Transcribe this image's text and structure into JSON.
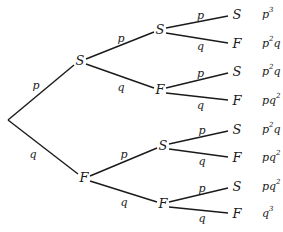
{
  "diagram": {
    "type": "probability-tree",
    "root": {
      "x": 8,
      "y": 120
    },
    "level1": [
      {
        "label": "S",
        "x": 80,
        "y": 61,
        "edge_label": "p",
        "edge_label_pos": [
          36,
          86
        ]
      },
      {
        "label": "F",
        "x": 84,
        "y": 178,
        "edge_label": "q",
        "edge_label_pos": [
          33,
          155
        ]
      }
    ],
    "level2": [
      {
        "label": "S",
        "parent": 0,
        "x": 160,
        "y": 30,
        "edge_label": "p",
        "edge_label_pos": [
          121,
          39
        ]
      },
      {
        "label": "F",
        "parent": 0,
        "x": 160,
        "y": 90,
        "edge_label": "q",
        "edge_label_pos": [
          121,
          88
        ]
      },
      {
        "label": "S",
        "parent": 1,
        "x": 163,
        "y": 146,
        "edge_label": "p",
        "edge_label_pos": [
          124,
          155
        ]
      },
      {
        "label": "F",
        "parent": 1,
        "x": 163,
        "y": 204,
        "edge_label": "q",
        "edge_label_pos": [
          124,
          203
        ]
      }
    ],
    "leaves": [
      {
        "label": "S",
        "parent": 0,
        "y": 15,
        "edge_label": "p",
        "prob_base": "p",
        "prob_sup": "3",
        "prob_tail": ""
      },
      {
        "label": "F",
        "parent": 0,
        "y": 44,
        "edge_label": "q",
        "prob_base": "p",
        "prob_sup": "2",
        "prob_tail": "q"
      },
      {
        "label": "S",
        "parent": 1,
        "y": 72,
        "edge_label": "p",
        "prob_base": "p",
        "prob_sup": "2",
        "prob_tail": "q"
      },
      {
        "label": "F",
        "parent": 1,
        "y": 101,
        "edge_label": "q",
        "prob_base": "pq",
        "prob_sup": "2",
        "prob_tail": ""
      },
      {
        "label": "S",
        "parent": 2,
        "y": 130,
        "edge_label": "p",
        "prob_base": "p",
        "prob_sup": "2",
        "prob_tail": "q"
      },
      {
        "label": "F",
        "parent": 2,
        "y": 158,
        "edge_label": "q",
        "prob_base": "pq",
        "prob_sup": "2",
        "prob_tail": ""
      },
      {
        "label": "S",
        "parent": 3,
        "y": 187,
        "edge_label": "p",
        "prob_base": "pq",
        "prob_sup": "2",
        "prob_tail": ""
      },
      {
        "label": "F",
        "parent": 3,
        "y": 214,
        "edge_label": "q",
        "prob_base": "q",
        "prob_sup": "3",
        "prob_tail": ""
      }
    ],
    "leaf_x": 237,
    "prob_x": 262,
    "colors": {
      "ink": "#1a1a1a",
      "background": "#ffffff"
    }
  }
}
